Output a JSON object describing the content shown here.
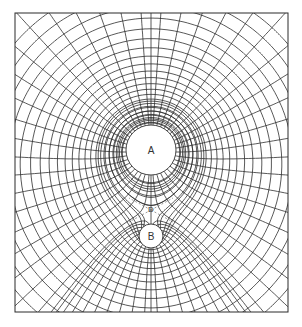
{
  "figure": {
    "type": "field-line diagram of two like charges",
    "frame": {
      "x": 15,
      "y": 13,
      "width": 273,
      "height": 299
    },
    "line_color": "#2f2f2f",
    "background": "#ffffff"
  },
  "charges": [
    {
      "id": "A",
      "label": "A",
      "cx": 151,
      "cy": 150,
      "r": 25,
      "strength": 4
    },
    {
      "id": "B",
      "label": "B",
      "cx": 151,
      "cy": 236,
      "r": 12,
      "strength": 1
    }
  ],
  "saddle_point": {
    "label": "D",
    "cx": 151,
    "cy": 210
  },
  "field_lines": {
    "count_A": 40,
    "count_B": 20
  },
  "equipotentials": {
    "count": 22
  }
}
